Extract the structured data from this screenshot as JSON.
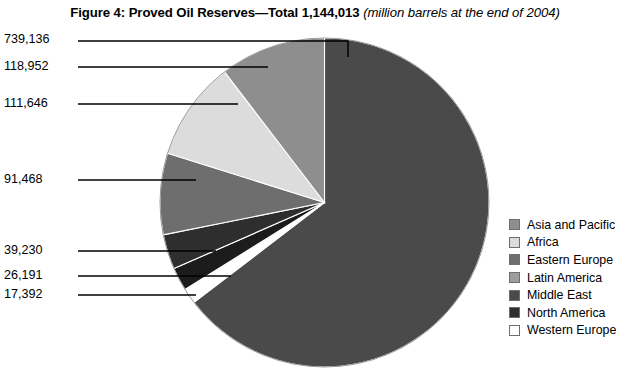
{
  "title": {
    "main": "Figure 4: Proved Oil Reserves—Total 1,144,013",
    "sub": "(million barrels at the end of 2004)"
  },
  "chart_data": {
    "type": "pie",
    "subtitle": "million barrels at the end of 2004",
    "units": "million barrels",
    "total": 1144013,
    "total_label": "1,144,013",
    "legend_position": "right",
    "grid": false,
    "start_angle_deg": 0,
    "direction": "clockwise",
    "categories": [
      "Middle East",
      "Western Europe",
      "North America",
      "Eastern Europe",
      "Latin America",
      "Africa",
      "Asia and Pacific"
    ],
    "values": [
      739136,
      17392,
      26191,
      39230,
      91468,
      111646,
      118952
    ],
    "labels": [
      "739,136",
      "17,392",
      "26,191",
      "39,230",
      "91,468",
      "111,646",
      "118,952"
    ],
    "colors": [
      "#4a4a4a",
      "#ffffff",
      "#1c1c1c",
      "#2e2e2e",
      "#6e6e6e",
      "#dcdcdc",
      "#8e8e8e"
    ],
    "slices": [
      {
        "name": "Middle East",
        "value": 739136,
        "label": "739,136",
        "color": "#4a4a4a"
      },
      {
        "name": "Western Europe",
        "value": 17392,
        "label": "17,392",
        "color": "#ffffff"
      },
      {
        "name": "North America",
        "value": 26191,
        "label": "26,191",
        "color": "#1c1c1c"
      },
      {
        "name": "Eastern Europe",
        "value": 39230,
        "label": "39,230",
        "color": "#2e2e2e"
      },
      {
        "name": "Latin America",
        "value": 91468,
        "label": "91,468",
        "color": "#6e6e6e"
      },
      {
        "name": "Africa",
        "value": 111646,
        "label": "111,646",
        "color": "#dcdcdc"
      },
      {
        "name": "Asia and Pacific",
        "value": 118952,
        "label": "118,952",
        "color": "#8e8e8e"
      }
    ]
  },
  "callouts": [
    {
      "label": "739,136"
    },
    {
      "label": "118,952"
    },
    {
      "label": "111,646"
    },
    {
      "label": "91,468"
    },
    {
      "label": "39,230"
    },
    {
      "label": "26,191"
    },
    {
      "label": "17,392"
    }
  ],
  "legend": {
    "items": [
      {
        "label": "Asia and Pacific",
        "color": "#8e8e8e"
      },
      {
        "label": "Africa",
        "color": "#dcdcdc"
      },
      {
        "label": "Eastern Europe",
        "color": "#6e6e6e"
      },
      {
        "label": "Latin America",
        "color": "#9d9d9d"
      },
      {
        "label": "Middle East",
        "color": "#4a4a4a"
      },
      {
        "label": "North America",
        "color": "#2e2e2e"
      },
      {
        "label": "Western Europe",
        "color": "#ffffff"
      }
    ]
  }
}
